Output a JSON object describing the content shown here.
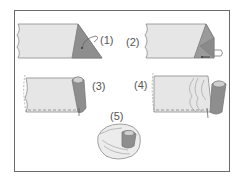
{
  "diagram": {
    "steps": [
      {
        "id": 1,
        "label": "(1)",
        "description": "fabric with diagonal corner fold, arrow pointing to folded triangle"
      },
      {
        "id": 2,
        "label": "(2)",
        "description": "corner folded over with tab, arrow inward"
      },
      {
        "id": 3,
        "label": "(3)",
        "description": "edge rolled into tube, dashed stitch line"
      },
      {
        "id": 4,
        "label": "(4)",
        "description": "fabric gathered and rolled with dashed stitch line"
      },
      {
        "id": 5,
        "label": "(5)",
        "description": "finished rolled rose shape"
      }
    ],
    "colors": {
      "fabric_light": "#e6e6e6",
      "fabric_dark": "#8e8e8e",
      "outline": "#7a7a7a",
      "frame": "#6a6a6a",
      "label": "#555555"
    }
  }
}
